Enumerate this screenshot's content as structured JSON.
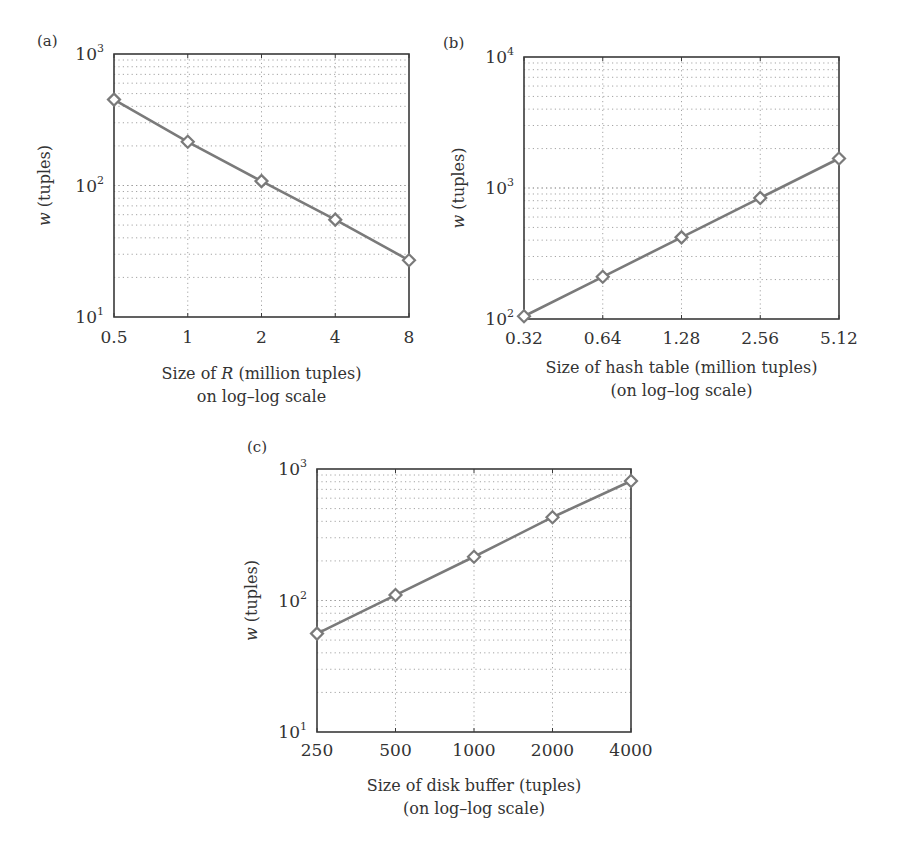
{
  "figure": {
    "panels": [
      "(a)",
      "(b)",
      "(c)"
    ]
  },
  "colors": {
    "line": "#7a7a7a",
    "frame": "#3a3a3a",
    "grid": "#9a9a9a",
    "text": "#333333"
  },
  "chart_data": [
    {
      "type": "line",
      "panel": "(a)",
      "title": "",
      "xlabel": [
        "Size of R (million tuples)",
        "on log–log scale"
      ],
      "xlabel_italic_word": "R",
      "ylabel": "w (tuples)",
      "xscale": "log",
      "yscale": "log",
      "categories": [
        "0.5",
        "1",
        "2",
        "4",
        "8"
      ],
      "x": [
        0.5,
        1,
        2,
        4,
        8
      ],
      "series": [
        {
          "name": "w",
          "marker": "diamond",
          "values": [
            450,
            215,
            108,
            55,
            27
          ]
        }
      ],
      "ylim": [
        10,
        1000
      ],
      "yticks": [
        {
          "base": "10",
          "exp": "1"
        },
        {
          "base": "10",
          "exp": "2"
        },
        {
          "base": "10",
          "exp": "3"
        }
      ],
      "grid": true,
      "legend": null
    },
    {
      "type": "line",
      "panel": "(b)",
      "title": "",
      "xlabel": [
        "Size of hash table (million tuples)",
        "(on log–log scale)"
      ],
      "ylabel": "w (tuples)",
      "xscale": "log",
      "yscale": "log",
      "categories": [
        "0.32",
        "0.64",
        "1.28",
        "2.56",
        "5.12"
      ],
      "x": [
        0.32,
        0.64,
        1.28,
        2.56,
        5.12
      ],
      "series": [
        {
          "name": "w",
          "marker": "diamond",
          "values": [
            105,
            210,
            420,
            840,
            1680
          ]
        }
      ],
      "ylim": [
        100,
        10000
      ],
      "yticks": [
        {
          "base": "10",
          "exp": "2"
        },
        {
          "base": "10",
          "exp": "3"
        },
        {
          "base": "10",
          "exp": "4"
        }
      ],
      "grid": true,
      "legend": null
    },
    {
      "type": "line",
      "panel": "(c)",
      "title": "",
      "xlabel": [
        "Size of disk buffer (tuples)",
        "(on log–log scale)"
      ],
      "ylabel": "w (tuples)",
      "xscale": "log",
      "yscale": "log",
      "categories": [
        "250",
        "500",
        "1000",
        "2000",
        "4000"
      ],
      "x": [
        250,
        500,
        1000,
        2000,
        4000
      ],
      "series": [
        {
          "name": "w",
          "marker": "diamond",
          "values": [
            56,
            110,
            215,
            430,
            810
          ]
        }
      ],
      "ylim": [
        10,
        1000
      ],
      "yticks": [
        {
          "base": "10",
          "exp": "1"
        },
        {
          "base": "10",
          "exp": "2"
        },
        {
          "base": "10",
          "exp": "3"
        }
      ],
      "grid": true,
      "legend": null
    }
  ]
}
